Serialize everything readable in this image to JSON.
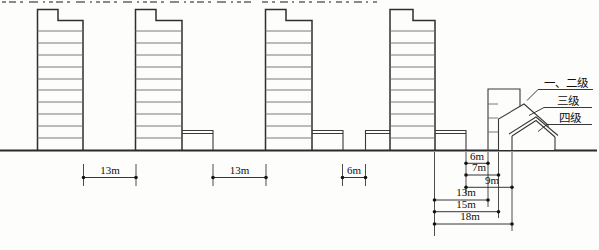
{
  "figure": {
    "grade_labels": {
      "grade_1_2": "一、二级",
      "grade_3": "三级",
      "grade_4": "四级"
    },
    "dimensions": {
      "gap_1": "13m",
      "gap_2": "13m",
      "gap_3": "6m",
      "podium_to_grade12": "6m",
      "podium_to_grade3": "7m",
      "podium_to_grade4": "9m",
      "tower_to_grade12": "13m",
      "tower_to_grade3": "15m",
      "tower_to_grade4": "18m"
    }
  }
}
